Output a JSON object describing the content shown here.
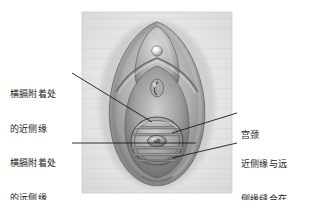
{
  "figure": {
    "type": "medical-illustration",
    "panel": {
      "x": 82,
      "y": 12,
      "width": 150,
      "height": 181,
      "background_color": "#e9e9e9",
      "border_color": "#cfcfcf"
    },
    "palette": {
      "page_background": "#ffffff",
      "illustration_light": "#dedede",
      "illustration_mid": "#a9a9a9",
      "illustration_dark": "#6e6e6e",
      "illustration_shadow": "#4a4a4a",
      "highlight": "#f4f4f4",
      "leader_line": "#1b1b1b",
      "text": "#1b1b1b"
    },
    "structures": [
      {
        "name": "labia-majora-outer-oval",
        "shape": "vertical-oval"
      },
      {
        "name": "labia-minora-inner-fold",
        "shape": "vertical-oval"
      },
      {
        "name": "clitoris-highlight",
        "shape": "small-sphere"
      },
      {
        "name": "urethral-opening",
        "shape": "small-slit"
      },
      {
        "name": "diaphragm-ring",
        "shape": "circle"
      },
      {
        "name": "diaphragm-membrane-bands",
        "count": 5,
        "shape": "horizontal-bands"
      },
      {
        "name": "cervix-bump",
        "shape": "small-ellipse"
      }
    ]
  },
  "labels": [
    {
      "id": "proximal-rim",
      "side": "left",
      "lines": [
        "横膈附着处",
        "的近侧缘"
      ],
      "text_x": 10,
      "text_y": 68,
      "leader": {
        "from_x": 72,
        "from_y": 73,
        "to_x": 152,
        "to_y": 122
      }
    },
    {
      "id": "distal-rim",
      "side": "left",
      "lines": [
        "横膈附着处",
        "的远侧缘"
      ],
      "text_x": 10,
      "text_y": 137,
      "leader": {
        "from_x": 72,
        "from_y": 143,
        "to_x": 196,
        "to_y": 143
      }
    },
    {
      "id": "cervix",
      "side": "right",
      "lines": [
        "宫颈"
      ],
      "text_x": 240,
      "text_y": 108,
      "leader": {
        "from_x": 237,
        "from_y": 113,
        "to_x": 172,
        "to_y": 133
      }
    },
    {
      "id": "rims-sutured-together",
      "side": "right",
      "lines": [
        "近侧缘与远",
        "侧缘缝合在",
        "一起"
      ],
      "text_x": 240,
      "text_y": 138,
      "leader": {
        "from_x": 237,
        "from_y": 143,
        "to_x": 172,
        "to_y": 158
      }
    }
  ]
}
